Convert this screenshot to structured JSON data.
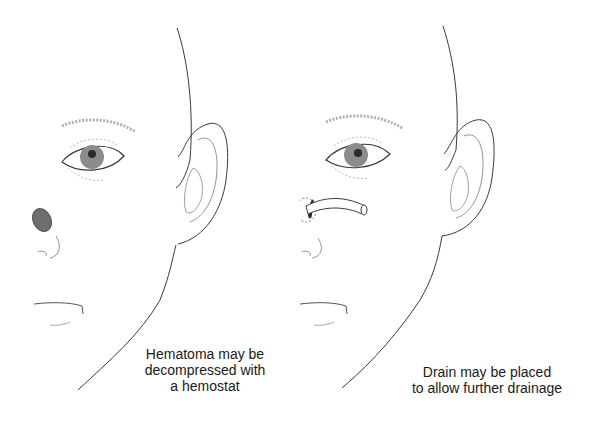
{
  "figure": {
    "panels": [
      {
        "id": "left",
        "caption_lines": [
          "Hematoma may be",
          "decompressed with",
          "a hemostat"
        ],
        "hematoma_color": "#6e6e6e"
      },
      {
        "id": "right",
        "caption_lines": [
          "Drain may be placed",
          "to allow further drainage"
        ],
        "drain_color": "#ffffff"
      }
    ],
    "colors": {
      "line": "#3a3a3a",
      "iris": "#8c8c8c",
      "pupil": "#2a2a2a",
      "brow": "#b0b0b0"
    }
  }
}
